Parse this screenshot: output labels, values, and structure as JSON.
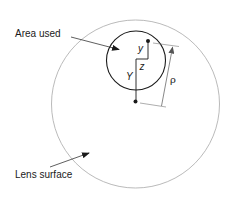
{
  "diagram": {
    "labels": {
      "area_used": "Area used",
      "lens_surface": "Lens surface"
    },
    "symbols": {
      "small_y": "y",
      "z": "z",
      "big_y": "Y",
      "rho": "ρ"
    },
    "colors": {
      "lens_outline": "#a8a8a8",
      "area_outline": "#1a1a1a",
      "lines": "#1a1a1a",
      "dimension_lines": "#777777"
    }
  }
}
